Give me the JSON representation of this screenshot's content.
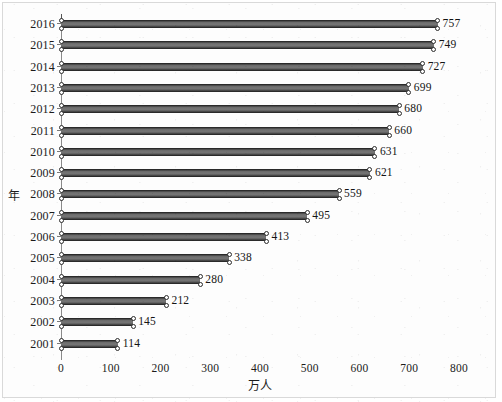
{
  "chart_data": {
    "type": "bar",
    "orientation": "horizontal",
    "title": "",
    "xlabel": "万人",
    "ylabel": "年",
    "xlim": [
      0,
      800
    ],
    "ylim": null,
    "grid": false,
    "legend": null,
    "xticks": [
      "0",
      "100",
      "200",
      "300",
      "400",
      "500",
      "600",
      "700",
      "800"
    ],
    "xtick_values": [
      0,
      100,
      200,
      300,
      400,
      500,
      600,
      700,
      800
    ],
    "categories": [
      "2016",
      "2015",
      "2014",
      "2013",
      "2012",
      "2011",
      "2010",
      "2009",
      "2008",
      "2007",
      "2006",
      "2005",
      "2004",
      "2003",
      "2002",
      "2001"
    ],
    "values": [
      757,
      749,
      727,
      699,
      680,
      660,
      631,
      621,
      559,
      495,
      413,
      338,
      280,
      212,
      145,
      114
    ],
    "data_labels": [
      "757",
      "749",
      "727",
      "699",
      "680",
      "660",
      "631",
      "621",
      "559",
      "495",
      "413",
      "338",
      "280",
      "212",
      "145",
      "114"
    ],
    "series": [
      {
        "name": "万人",
        "values": [
          757,
          749,
          727,
          699,
          680,
          660,
          631,
          621,
          559,
          495,
          413,
          338,
          280,
          212,
          145,
          114
        ]
      }
    ],
    "points": [
      {
        "category": "2016",
        "value": 757
      },
      {
        "category": "2015",
        "value": 749
      },
      {
        "category": "2014",
        "value": 727
      },
      {
        "category": "2013",
        "value": 699
      },
      {
        "category": "2012",
        "value": 680
      },
      {
        "category": "2011",
        "value": 660
      },
      {
        "category": "2010",
        "value": 631
      },
      {
        "category": "2009",
        "value": 621
      },
      {
        "category": "2008",
        "value": 559
      },
      {
        "category": "2007",
        "value": 495
      },
      {
        "category": "2006",
        "value": 413
      },
      {
        "category": "2005",
        "value": 338
      },
      {
        "category": "2004",
        "value": 280
      },
      {
        "category": "2003",
        "value": 212
      },
      {
        "category": "2002",
        "value": 145
      },
      {
        "category": "2001",
        "value": 114
      }
    ],
    "colors": {
      "bar": "#6a6a6a",
      "bar_edge": "#2a2a2a",
      "axis": "#8a8a8a",
      "text": "#1b1b1b",
      "background": "#fdfdfd",
      "frame": "#d9d9d9"
    }
  }
}
